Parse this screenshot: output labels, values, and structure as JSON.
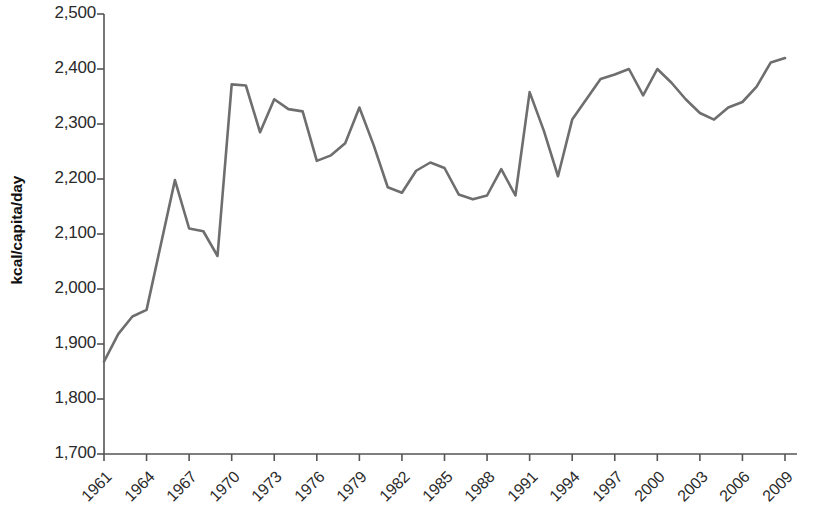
{
  "chart_data": {
    "type": "line",
    "title": "",
    "xlabel": "",
    "ylabel": "kcal/capita/day",
    "xlim": [
      1961,
      2009
    ],
    "ylim": [
      1700,
      2500
    ],
    "grid": false,
    "legend": "none",
    "line_color": "#6e6e6e",
    "line_width": 2.6,
    "y_ticks": [
      "1,700",
      "1,800",
      "1,900",
      "2,000",
      "2,100",
      "2,200",
      "2,300",
      "2,400",
      "2,500"
    ],
    "y_tick_values": [
      1700,
      1800,
      1900,
      2000,
      2100,
      2200,
      2300,
      2400,
      2500
    ],
    "x_ticks": [
      "1961",
      "1964",
      "1967",
      "1970",
      "1973",
      "1976",
      "1979",
      "1982",
      "1985",
      "1988",
      "1991",
      "1994",
      "1997",
      "2000",
      "2003",
      "2006",
      "2009"
    ],
    "x_tick_values": [
      1961,
      1964,
      1967,
      1970,
      1973,
      1976,
      1979,
      1982,
      1985,
      1988,
      1991,
      1994,
      1997,
      2000,
      2003,
      2006,
      2009
    ],
    "x": [
      1961,
      1962,
      1963,
      1964,
      1965,
      1966,
      1967,
      1968,
      1969,
      1970,
      1971,
      1972,
      1973,
      1974,
      1975,
      1976,
      1977,
      1978,
      1979,
      1980,
      1981,
      1982,
      1983,
      1984,
      1985,
      1986,
      1987,
      1988,
      1989,
      1990,
      1991,
      1992,
      1993,
      1994,
      1995,
      1996,
      1997,
      1998,
      1999,
      2000,
      2001,
      2002,
      2003,
      2004,
      2005,
      2006,
      2007,
      2008,
      2009
    ],
    "values": [
      1868,
      1918,
      1950,
      1962,
      2080,
      2198,
      2110,
      2105,
      2060,
      2372,
      2370,
      2285,
      2345,
      2327,
      2323,
      2233,
      2243,
      2265,
      2330,
      2262,
      2185,
      2175,
      2215,
      2230,
      2220,
      2172,
      2163,
      2170,
      2218,
      2170,
      2358,
      2288,
      2205,
      2308,
      2345,
      2382,
      2390,
      2400,
      2352,
      2400,
      2375,
      2345,
      2320,
      2308,
      2330,
      2340,
      2368,
      2412,
      2420
    ],
    "series": [
      {
        "name": "kcal/capita/day",
        "values": [
          1868,
          1918,
          1950,
          1962,
          2080,
          2198,
          2110,
          2105,
          2060,
          2372,
          2370,
          2285,
          2345,
          2327,
          2323,
          2233,
          2243,
          2265,
          2330,
          2262,
          2185,
          2175,
          2215,
          2230,
          2220,
          2172,
          2163,
          2170,
          2218,
          2170,
          2358,
          2288,
          2205,
          2308,
          2345,
          2382,
          2390,
          2400,
          2352,
          2400,
          2375,
          2345,
          2320,
          2308,
          2330,
          2340,
          2368,
          2412,
          2420
        ]
      }
    ]
  }
}
